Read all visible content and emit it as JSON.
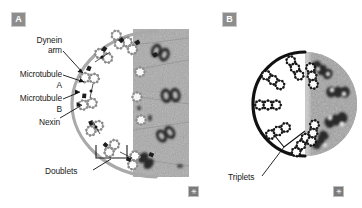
{
  "figure": {
    "width": 362,
    "height": 208,
    "background": "#ffffff",
    "type": "scientific-micrograph-diagram"
  },
  "panels": [
    {
      "tag": "A",
      "tag_color": "#8d8d8d",
      "diagram_type": "axoneme-cross-section",
      "structure_count": 9,
      "structure_name": "doublets",
      "membrane_color": "#a8a8a8",
      "micrograph": {
        "kind": "electron-micrograph",
        "shape": "rectangle",
        "base_color": "#9b9b9b"
      },
      "labels": [
        {
          "id": "dynein-arm",
          "line1": "Dynein",
          "line2": "arm"
        },
        {
          "id": "microtubule-a",
          "line1": "Microtubule",
          "line2": "A"
        },
        {
          "id": "microtubule-b",
          "line1": "Microtubule",
          "line2": "B"
        },
        {
          "id": "nexin",
          "line1": "Nexin",
          "line2": ""
        },
        {
          "id": "doublets",
          "line1": "Doublets",
          "line2": ""
        }
      ]
    },
    {
      "tag": "B",
      "tag_color": "#8d8d8d",
      "diagram_type": "basal-body-cross-section",
      "structure_count": 9,
      "structure_name": "triplets",
      "membrane_color": "#111111",
      "micrograph": {
        "kind": "electron-micrograph",
        "shape": "circle",
        "base_color": "#8f8f8f"
      },
      "labels": [
        {
          "id": "triplets",
          "line1": "Triplets",
          "line2": ""
        }
      ]
    }
  ],
  "corner_marks": [
    {
      "id": "mark-a",
      "glyph": "✳"
    },
    {
      "id": "mark-b",
      "glyph": "✳"
    }
  ]
}
